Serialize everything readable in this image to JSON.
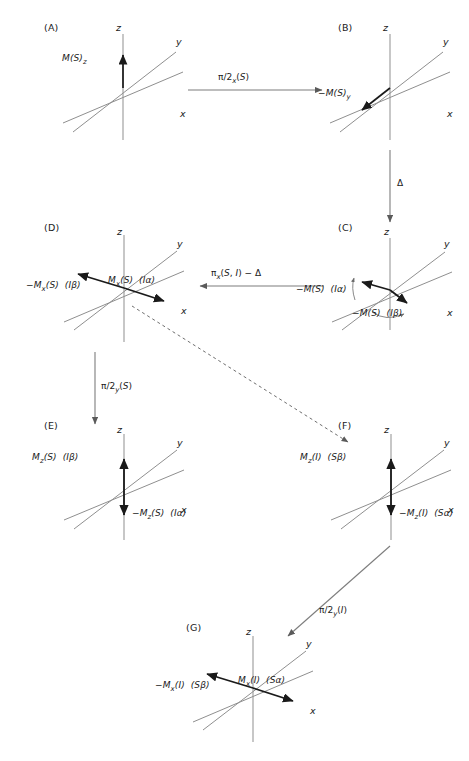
{
  "figure": {
    "type": "nmr-vector-diagram",
    "background": "#ffffff",
    "axis_color": "#8a8a8a",
    "vector_color": "#1a1a1a",
    "arrow_color": "#7d7d7d"
  },
  "panels": [
    {
      "id": "A",
      "label": "(A)",
      "axes": [
        "z",
        "y",
        "x"
      ],
      "vectors": [
        {
          "label": "M(S)",
          "sub": "z",
          "qualifier": "",
          "direction": "up-z"
        }
      ]
    },
    {
      "id": "B",
      "label": "(B)",
      "axes": [
        "z",
        "y",
        "x"
      ],
      "vectors": [
        {
          "label": "−M(S)",
          "sub": "y",
          "qualifier": "",
          "direction": "minus-y"
        }
      ]
    },
    {
      "id": "C",
      "label": "(C)",
      "axes": [
        "z",
        "y",
        "x"
      ],
      "vectors": [
        {
          "label": "−M(S)",
          "sub": "",
          "qualifier": "(Iα)",
          "direction": "fan-left"
        },
        {
          "label": "−M(S)",
          "sub": "",
          "qualifier": "(Iβ)",
          "direction": "fan-right"
        }
      ],
      "rotation_arrows": 2
    },
    {
      "id": "D",
      "label": "(D)",
      "axes": [
        "z",
        "y",
        "x"
      ],
      "vectors": [
        {
          "label": "−M",
          "sub": "x",
          "tail": "(S)",
          "qualifier": "(Iβ)",
          "direction": "minus-x"
        },
        {
          "label": "M",
          "sub": "x",
          "tail": "(S)",
          "qualifier": "(Iα)",
          "direction": "plus-x"
        }
      ]
    },
    {
      "id": "E",
      "label": "(E)",
      "axes": [
        "z",
        "y",
        "x"
      ],
      "vectors": [
        {
          "label": "M",
          "sub": "z",
          "tail": "(S)",
          "qualifier": "(Iβ)",
          "direction": "up-z"
        },
        {
          "label": "−M",
          "sub": "z",
          "tail": "(S)",
          "qualifier": "(Iα)",
          "direction": "down-z"
        }
      ]
    },
    {
      "id": "F",
      "label": "(F)",
      "axes": [
        "z",
        "y",
        "x"
      ],
      "vectors": [
        {
          "label": "M",
          "sub": "z",
          "tail": "(I)",
          "qualifier": "(Sβ)",
          "direction": "up-z"
        },
        {
          "label": "−M",
          "sub": "z",
          "tail": "(I)",
          "qualifier": "(Sα)",
          "direction": "down-z"
        }
      ]
    },
    {
      "id": "G",
      "label": "(G)",
      "axes": [
        "z",
        "y",
        "x"
      ],
      "vectors": [
        {
          "label": "−M",
          "sub": "x",
          "tail": "(I)",
          "qualifier": "(Sβ)",
          "direction": "minus-x"
        },
        {
          "label": "M",
          "sub": "x",
          "tail": "(I)",
          "qualifier": "(Sα)",
          "direction": "plus-x"
        }
      ]
    }
  ],
  "transitions": [
    {
      "id": "a-to-b",
      "from": "A",
      "to": "B",
      "style": "solid",
      "orientation": "horizontal-right",
      "label_pre": "π/2",
      "label_sub": "x",
      "label_post": "(S)"
    },
    {
      "id": "b-to-c",
      "from": "B",
      "to": "C",
      "style": "solid",
      "orientation": "vertical-down",
      "label_pre": "Δ",
      "label_sub": "",
      "label_post": ""
    },
    {
      "id": "c-to-d",
      "from": "C",
      "to": "D",
      "style": "solid",
      "orientation": "horizontal-left",
      "label_pre": "π",
      "label_sub": "x",
      "label_post": "(S, I) − Δ"
    },
    {
      "id": "d-to-e",
      "from": "D",
      "to": "E",
      "style": "solid",
      "orientation": "vertical-down",
      "label_pre": "π/2",
      "label_sub": "y",
      "label_post": "(S)"
    },
    {
      "id": "d-to-f",
      "from": "D",
      "to": "F",
      "style": "dashed",
      "orientation": "diagonal-down-right",
      "label_pre": "",
      "label_sub": "",
      "label_post": ""
    },
    {
      "id": "f-to-g",
      "from": "F",
      "to": "G",
      "style": "solid",
      "orientation": "diagonal-down-left",
      "label_pre": "π/2",
      "label_sub": "y",
      "label_post": "(I)"
    }
  ],
  "axis_names": {
    "z": "z",
    "y": "y",
    "x": "x"
  },
  "panel_labels": {
    "A": "(A)",
    "B": "(B)",
    "C": "(C)",
    "D": "(D)",
    "E": "(E)",
    "F": "(F)",
    "G": "(G)"
  },
  "vector_text": {
    "A_z": "M(S)z",
    "B_y": "−M(S)y",
    "C_alpha": "−M(S)  (Iα)",
    "C_beta": "−M(S)  (Iβ)",
    "D_beta": "−Mx(S)  (Iβ)",
    "D_alpha": "Mx(S)  (Iα)",
    "E_beta": "Mz(S)  (Iβ)",
    "E_alpha": "−Mz(S)  (Iα)",
    "F_beta": "Mz(I)  (Sβ)",
    "F_alpha": "−Mz(I)  (Sα)",
    "G_beta": "−Mx(I)  (Sβ)",
    "G_alpha": "Mx(I)  (Sα)"
  },
  "transition_text": {
    "a_b": "π/2x(S)",
    "b_c": "Δ",
    "c_d": "πx(S, I) − Δ",
    "d_e": "π/2y(S)",
    "f_g": "π/2y(I)"
  }
}
